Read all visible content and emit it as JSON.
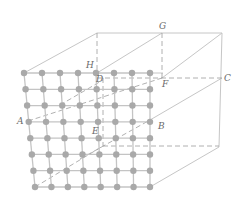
{
  "figure": {
    "colors": {
      "line": "#c4c4c4",
      "dashed": "#9a9a9a",
      "dot": "#a9a9a9",
      "label": "#6a6a6a"
    },
    "labels": [
      {
        "id": "A",
        "text": "A",
        "x": 17,
        "y": 118
      },
      {
        "id": "B",
        "text": "B",
        "x": 158,
        "y": 123
      },
      {
        "id": "C",
        "text": "C",
        "x": 224,
        "y": 74
      },
      {
        "id": "D",
        "text": "D",
        "x": 97,
        "y": 75
      },
      {
        "id": "E",
        "text": "E",
        "x": 92,
        "y": 127
      },
      {
        "id": "F",
        "text": "F",
        "x": 162,
        "y": 80
      },
      {
        "id": "G",
        "text": "G",
        "x": 159,
        "y": 22
      },
      {
        "id": "H",
        "text": "H",
        "x": 86,
        "y": 61
      }
    ],
    "lattice": {
      "rows": 8,
      "cols": 8,
      "top_left": [
        24,
        73
      ],
      "top_right": [
        150,
        73
      ],
      "bottom_left": [
        35,
        187
      ],
      "bottom_right": [
        150,
        187
      ]
    }
  }
}
